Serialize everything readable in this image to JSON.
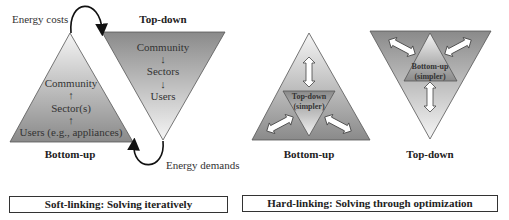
{
  "soft_linking": {
    "energy_costs_label": "Energy costs",
    "energy_demands_label": "Energy demands",
    "top_down": {
      "title": "Top-down",
      "levels": [
        "Community",
        "↓",
        "Sectors",
        "↓",
        "Users"
      ]
    },
    "bottom_up": {
      "title": "Bottom-up",
      "levels": [
        "Community",
        "↑",
        "Sector(s)",
        "↑",
        "Users (e.g., appliances)"
      ]
    },
    "caption": "Soft-linking: Solving iteratively"
  },
  "hard_linking": {
    "bottom_up": {
      "title": "Bottom-up",
      "inner_label_line1": "Top-down",
      "inner_label_line2": "(simpler)"
    },
    "top_down": {
      "title": "Top-down",
      "inner_label_line1": "Bottom-up",
      "inner_label_line2": "(simpler)"
    },
    "caption": "Hard-linking: Solving through optimization"
  },
  "colors": {
    "dark_fill": "#8a8a8a",
    "light_fill": "#f4f4f4",
    "outline": "#555555",
    "arrow_line": "#111111"
  }
}
